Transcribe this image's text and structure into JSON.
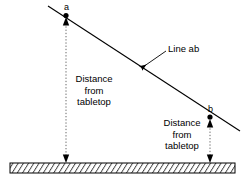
{
  "diagram": {
    "background_color": "#ffffff",
    "stroke_color": "#000000",
    "points": [
      {
        "id": "a",
        "label": "a",
        "x": 66,
        "y": 16
      },
      {
        "id": "b",
        "label": "b",
        "x": 210,
        "y": 117
      }
    ],
    "line": {
      "name": "line-ab",
      "label": "Line ab",
      "x1": 48,
      "y1": 6,
      "x2": 240,
      "y2": 131
    },
    "callout": {
      "label": "Line ab",
      "text_x": 168,
      "text_y": 44,
      "leader_x1": 166,
      "leader_y1": 51,
      "leader_x2": 140,
      "leader_y2": 69
    },
    "dimensions": [
      {
        "id": "left-dimension",
        "lines": [
          "Distance",
          "from",
          "tabletop"
        ],
        "guide_x": 66,
        "guide_y_top": 18,
        "guide_y_bottom": 162,
        "text_left": 68,
        "text_top": 73
      },
      {
        "id": "right-dimension",
        "lines": [
          "Distance",
          "from",
          "tabletop"
        ],
        "guide_x": 210,
        "guide_y_top": 119,
        "guide_y_bottom": 162,
        "text_left": 160,
        "text_top": 117
      }
    ],
    "tabletop": {
      "name": "tabletop",
      "x": 10,
      "y": 163,
      "width": 225,
      "height": 10,
      "hatch_style": "diagonal",
      "hatch_spacing": 5
    }
  }
}
